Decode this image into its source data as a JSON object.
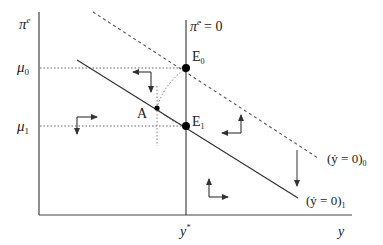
{
  "diagram": {
    "y_axis_label": "π",
    "y_axis_sup": "e",
    "x_axis_label": "y",
    "x_tick_label": "y",
    "x_tick_sup": "*",
    "mu0_label": "μ",
    "mu0_sub": "0",
    "mu1_label": "μ",
    "mu1_sub": "1",
    "vertical_locus_label": "π̇",
    "vertical_locus_sup": "e",
    "vertical_locus_eq": " = 0",
    "point_E0": "E",
    "point_E0_sub": "0",
    "point_E1": "E",
    "point_E1_sub": "1",
    "point_A": "A",
    "locus_initial_label": "(ẏ = 0)",
    "locus_initial_sub": "0",
    "locus_new_label": "(ẏ = 0)",
    "locus_new_sub": "1",
    "colors": {
      "line": "#333333",
      "dotted": "#777777",
      "point": "#000000"
    }
  }
}
